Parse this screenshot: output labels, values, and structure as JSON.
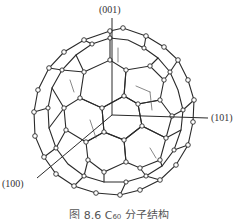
{
  "figure": {
    "axes": [
      {
        "label": "(001)",
        "direction": "up"
      },
      {
        "label": "(101)",
        "direction": "right"
      },
      {
        "label": "(100)",
        "direction": "lower-left"
      }
    ],
    "caption": "图 8.6  C₆₀ 分子结构"
  },
  "colors": {
    "line": "#2a2a2a",
    "background": "#ffffff"
  }
}
